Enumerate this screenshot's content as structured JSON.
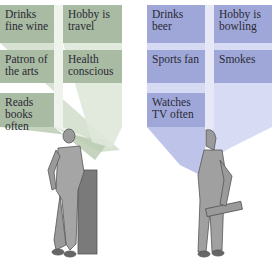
{
  "colors": {
    "upscale_box": "#a9bba2",
    "upscale_beam": "#c9d8c2",
    "downscale_box": "#9fa7d8",
    "downscale_beam": "#c2c7ec",
    "text": "#2a2a35"
  },
  "left_profile": {
    "figure": "man-in-suit-leaning-on-pillar",
    "traits": [
      {
        "label": "Drinks fine wine"
      },
      {
        "label": "Hobby is travel"
      },
      {
        "label": "Patron of the arts"
      },
      {
        "label": "Health conscious"
      },
      {
        "label": "Reads books often"
      }
    ]
  },
  "right_profile": {
    "figure": "man-carrying-toolbox",
    "traits": [
      {
        "label": "Drinks beer"
      },
      {
        "label": "Hobby is bowling"
      },
      {
        "label": "Sports fan"
      },
      {
        "label": "Smokes"
      },
      {
        "label": "Watches TV often"
      }
    ]
  }
}
